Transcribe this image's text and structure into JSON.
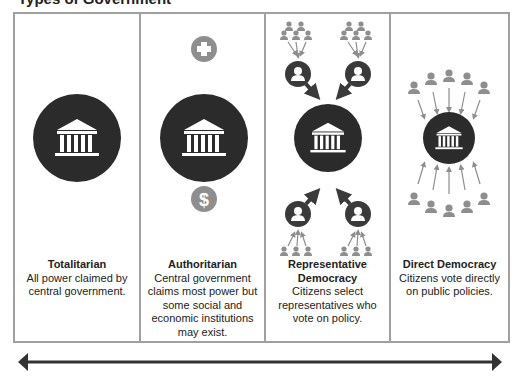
{
  "title": "Types of Government",
  "colors": {
    "border": "#a0a0a0",
    "dark_circle": "#2b2b2b",
    "gray_icon": "#8e8e8e",
    "arrow": "#333333"
  },
  "panels": [
    {
      "name": "Totalitarian",
      "description": "All power claimed by central government.",
      "icons": [
        "government-building-icon"
      ]
    },
    {
      "name": "Authoritarian",
      "description": "Central government claims most power but some social and economic institutions may exist.",
      "icons": [
        "plus-icon",
        "government-building-icon",
        "dollar-icon"
      ]
    },
    {
      "name": "Representative Democracy",
      "description": "Citizens select representatives who vote on policy.",
      "icons": [
        "citizen-group-icon",
        "representative-icon",
        "government-building-icon"
      ]
    },
    {
      "name": "Direct Democracy",
      "description": "Citizens vote directly on public policies.",
      "icons": [
        "citizen-icon",
        "government-building-icon"
      ]
    }
  ],
  "scale_arrow": "double-headed spectrum arrow"
}
